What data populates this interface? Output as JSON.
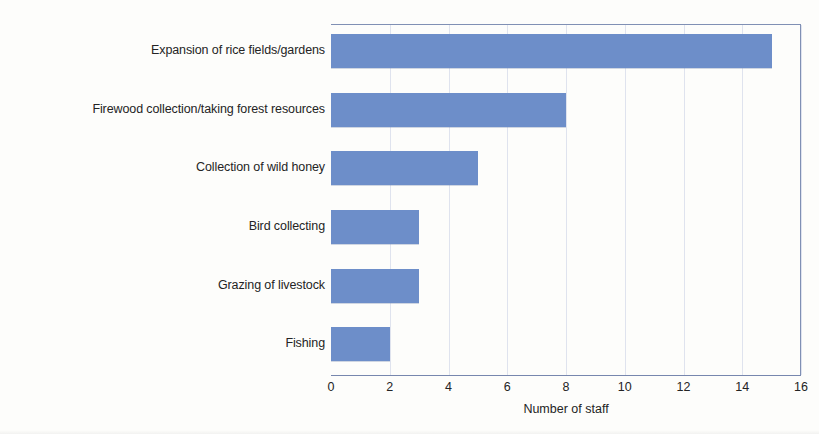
{
  "chart_data": {
    "type": "bar",
    "orientation": "horizontal",
    "title": "",
    "xlabel": "Number of staff",
    "ylabel": "",
    "categories": [
      "Expansion of rice fields/gardens",
      "Firewood collection/taking forest resources",
      "Collection of wild honey",
      "Bird collecting",
      "Grazing of livestock",
      "Fishing"
    ],
    "values": [
      15,
      8,
      5,
      3,
      3,
      2
    ],
    "xlim": [
      0,
      16
    ],
    "xticks": [
      0,
      2,
      4,
      6,
      8,
      10,
      12,
      14,
      16
    ],
    "xtick_labels": [
      "0",
      "2",
      "4",
      "6",
      "8",
      "10",
      "12",
      "14",
      "16"
    ],
    "grid": "vertical",
    "legend": "none",
    "bar_color": "#6d8ec9",
    "axis_color": "#8090b4",
    "gridline_color": "#dfe3ee",
    "background_color": "#fdfdfb"
  }
}
